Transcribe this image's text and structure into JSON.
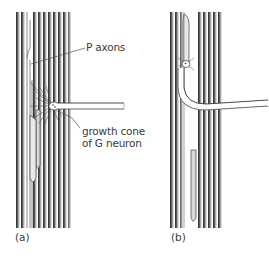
{
  "figure": {
    "panels": [
      {
        "id": "a",
        "label": "(a)",
        "annotations": {
          "p_axons": "P axons",
          "growth_cone_line1": "growth cone",
          "growth_cone_line2": "of G neuron"
        }
      },
      {
        "id": "b",
        "label": "(b)"
      }
    ],
    "colors": {
      "axon_dark": "#2e2e2e",
      "axon_mid": "#8a8a8a",
      "axon_light": "#e6e6e6",
      "line": "#555555",
      "background": "#ffffff"
    }
  }
}
